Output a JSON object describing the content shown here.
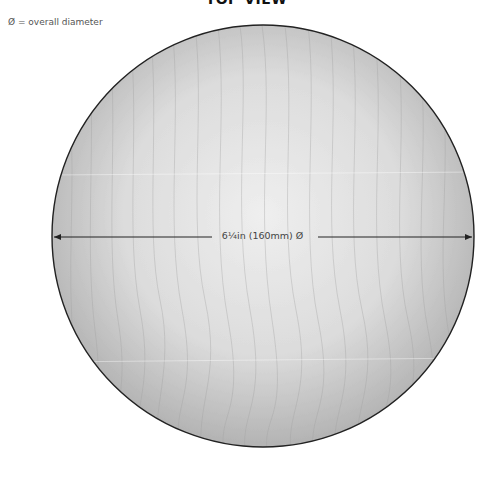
{
  "diagram": {
    "title": "TOP VIEW",
    "legend": "Ø = overall diameter",
    "dimension_label": "6¼in (160mm) Ø",
    "shape": "circle",
    "colors": {
      "center": "#ededed",
      "edge": "#b5b5b5",
      "outline": "#222222",
      "grain": "#9a9a9a",
      "arrow": "#222222"
    }
  }
}
